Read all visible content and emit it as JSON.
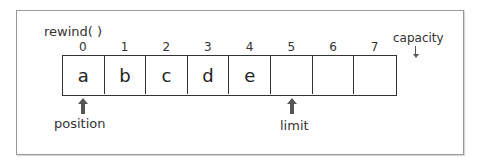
{
  "diagram": {
    "title": "rewind( )",
    "indices": [
      "0",
      "1",
      "2",
      "3",
      "4",
      "5",
      "6",
      "7"
    ],
    "cells": [
      "a",
      "b",
      "c",
      "d",
      "e",
      "",
      "",
      ""
    ],
    "capacity_label": "capacity",
    "position_label": "position",
    "limit_label": "limit",
    "position_index": 0,
    "limit_index": 5
  }
}
